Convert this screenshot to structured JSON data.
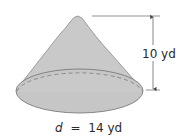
{
  "figure": {
    "shape": "cone",
    "height_label": "10 yd",
    "diameter_label": {
      "variable": "d",
      "equals": "=",
      "value": "14 yd"
    },
    "colors": {
      "fill": "#c9c9c9",
      "stroke": "#7a7a7a",
      "dimension_line": "#555555",
      "text": "#2a2a2a"
    }
  }
}
